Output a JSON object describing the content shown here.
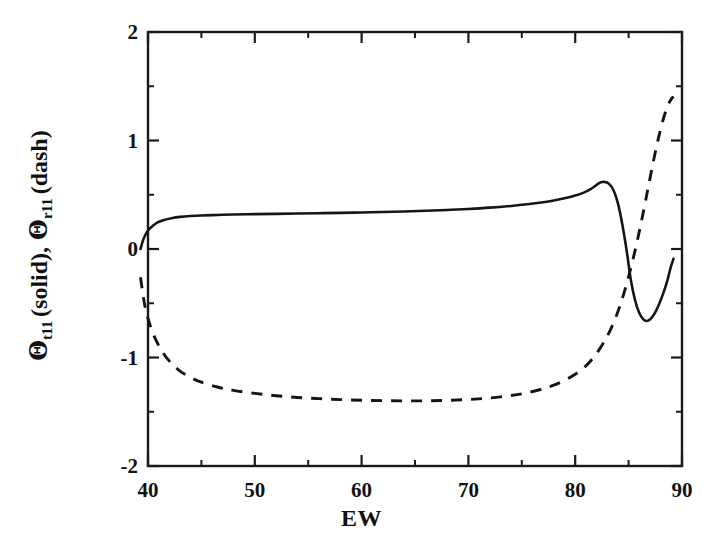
{
  "figure": {
    "background": "#ffffff",
    "ink_color": "#151515",
    "width": 723,
    "height": 553
  },
  "axes": {
    "xlabel": "EW",
    "ylabel_parts": {
      "theta": "Θ",
      "sub_t": "t",
      "sub_t_index": "11",
      "solid_note": "(solid),",
      "sub_r": "r",
      "sub_r_index": "11",
      "dash_note": "(dash)"
    },
    "ylabel_plain": "Θ t11 (solid), Θ r11 (dash)",
    "x_ticks": [
      "40",
      "50",
      "60",
      "70",
      "80",
      "90"
    ],
    "y_ticks": [
      "2",
      "1",
      "0",
      "-1",
      "-2"
    ]
  },
  "chart_data": {
    "type": "line",
    "title": "",
    "xlabel": "EW",
    "ylabel": "Θ_t11 (solid), Θ_r11 (dash)",
    "xlim": [
      40,
      90
    ],
    "ylim": [
      -2,
      2
    ],
    "x_major_ticks": [
      40,
      50,
      60,
      70,
      80,
      90
    ],
    "x_minor_ticks": [
      45,
      55,
      65,
      75,
      85
    ],
    "y_major_ticks": [
      -2,
      -1,
      0,
      1,
      2
    ],
    "y_minor_ticks": [
      -1.5,
      -0.5,
      0.5,
      1.5
    ],
    "grid": false,
    "legend": "none",
    "series": [
      {
        "name": "Θ_t11 (solid)",
        "style": "solid",
        "color": "#151515",
        "points": [
          [
            39.3,
            0.0
          ],
          [
            39.5,
            0.07
          ],
          [
            39.7,
            0.12
          ],
          [
            40.0,
            0.17
          ],
          [
            40.4,
            0.21
          ],
          [
            40.9,
            0.245
          ],
          [
            41.5,
            0.268
          ],
          [
            42.2,
            0.284
          ],
          [
            43.0,
            0.296
          ],
          [
            44.0,
            0.304
          ],
          [
            45.0,
            0.309
          ],
          [
            46.5,
            0.314
          ],
          [
            48.0,
            0.318
          ],
          [
            50.0,
            0.321
          ],
          [
            52.0,
            0.324
          ],
          [
            54.0,
            0.327
          ],
          [
            56.0,
            0.33
          ],
          [
            58.0,
            0.333
          ],
          [
            60.0,
            0.337
          ],
          [
            62.0,
            0.341
          ],
          [
            64.0,
            0.346
          ],
          [
            66.0,
            0.352
          ],
          [
            68.0,
            0.36
          ],
          [
            70.0,
            0.369
          ],
          [
            72.0,
            0.381
          ],
          [
            74.0,
            0.397
          ],
          [
            75.5,
            0.412
          ],
          [
            77.0,
            0.431
          ],
          [
            78.0,
            0.447
          ],
          [
            79.0,
            0.467
          ],
          [
            80.0,
            0.493
          ],
          [
            80.8,
            0.52
          ],
          [
            81.4,
            0.549
          ],
          [
            81.9,
            0.583
          ],
          [
            82.2,
            0.605
          ],
          [
            82.5,
            0.617
          ],
          [
            82.8,
            0.618
          ],
          [
            83.1,
            0.606
          ],
          [
            83.4,
            0.575
          ],
          [
            83.7,
            0.515
          ],
          [
            84.0,
            0.42
          ],
          [
            84.3,
            0.285
          ],
          [
            84.6,
            0.12
          ],
          [
            84.9,
            -0.07
          ],
          [
            85.2,
            -0.28
          ],
          [
            85.6,
            -0.47
          ],
          [
            86.0,
            -0.59
          ],
          [
            86.4,
            -0.65
          ],
          [
            86.7,
            -0.663
          ],
          [
            87.0,
            -0.65
          ],
          [
            87.4,
            -0.6
          ],
          [
            87.8,
            -0.52
          ],
          [
            88.2,
            -0.42
          ],
          [
            88.6,
            -0.3
          ],
          [
            88.9,
            -0.185
          ],
          [
            89.1,
            -0.12
          ],
          [
            89.2,
            -0.09
          ]
        ]
      },
      {
        "name": "Θ_r11 (dash)",
        "style": "dashed",
        "color": "#151515",
        "points": [
          [
            39.3,
            -0.26
          ],
          [
            39.5,
            -0.4
          ],
          [
            39.7,
            -0.52
          ],
          [
            40.0,
            -0.64
          ],
          [
            40.4,
            -0.76
          ],
          [
            40.9,
            -0.87
          ],
          [
            41.5,
            -0.97
          ],
          [
            42.2,
            -1.055
          ],
          [
            43.0,
            -1.125
          ],
          [
            44.0,
            -1.185
          ],
          [
            45.0,
            -1.228
          ],
          [
            46.5,
            -1.272
          ],
          [
            48.0,
            -1.303
          ],
          [
            50.0,
            -1.331
          ],
          [
            52.0,
            -1.352
          ],
          [
            54.0,
            -1.368
          ],
          [
            56.0,
            -1.379
          ],
          [
            58.0,
            -1.388
          ],
          [
            60.0,
            -1.394
          ],
          [
            62.0,
            -1.398
          ],
          [
            64.0,
            -1.4
          ],
          [
            66.0,
            -1.399
          ],
          [
            68.0,
            -1.395
          ],
          [
            70.0,
            -1.387
          ],
          [
            72.0,
            -1.373
          ],
          [
            74.0,
            -1.35
          ],
          [
            75.5,
            -1.325
          ],
          [
            77.0,
            -1.288
          ],
          [
            78.0,
            -1.255
          ],
          [
            79.0,
            -1.212
          ],
          [
            80.0,
            -1.155
          ],
          [
            80.8,
            -1.095
          ],
          [
            81.5,
            -1.025
          ],
          [
            82.2,
            -0.935
          ],
          [
            82.8,
            -0.84
          ],
          [
            83.3,
            -0.745
          ],
          [
            83.8,
            -0.63
          ],
          [
            84.2,
            -0.52
          ],
          [
            84.6,
            -0.395
          ],
          [
            85.0,
            -0.255
          ],
          [
            85.4,
            -0.1
          ],
          [
            85.8,
            0.07
          ],
          [
            86.2,
            0.255
          ],
          [
            86.6,
            0.45
          ],
          [
            87.0,
            0.65
          ],
          [
            87.4,
            0.845
          ],
          [
            87.8,
            1.025
          ],
          [
            88.2,
            1.18
          ],
          [
            88.5,
            1.275
          ],
          [
            88.8,
            1.35
          ],
          [
            89.1,
            1.395
          ],
          [
            89.2,
            1.405
          ]
        ]
      }
    ]
  }
}
